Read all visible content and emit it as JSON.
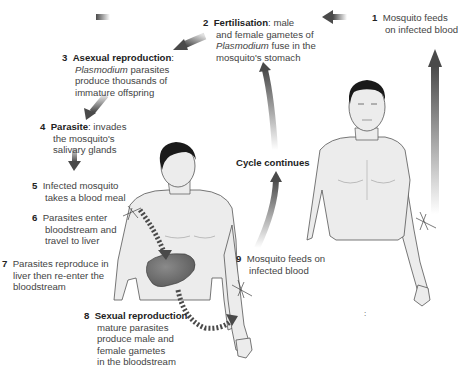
{
  "diagram": {
    "steps": [
      {
        "n": "1",
        "bold": "",
        "lines": [
          "Mosquito feeds",
          "on infected blood"
        ]
      },
      {
        "n": "2",
        "bold": "Fertilisation",
        "rest": ": male",
        "lines": [
          "and female gametes of",
          "Plasmodium fuse in the",
          "mosquito's stomach"
        ],
        "italic": "Plasmodium"
      },
      {
        "n": "3",
        "bold": "Asexual reproduction",
        "rest": ":",
        "lines": [
          "Plasmodium parasites",
          "produce thousands of",
          "immature offspring"
        ],
        "italic": "Plasmodium"
      },
      {
        "n": "4",
        "bold": "Parasite",
        "rest": ": invades",
        "lines": [
          "the mosquito's",
          "salivary glands"
        ]
      },
      {
        "n": "5",
        "bold": "",
        "lines": [
          "Infected mosquito",
          "takes a blood meal"
        ]
      },
      {
        "n": "6",
        "bold": "",
        "lines": [
          "Parasites enter",
          "bloodstream and",
          "travel to liver"
        ]
      },
      {
        "n": "7",
        "bold": "",
        "lines": [
          "Parasites reproduce in",
          "liver then re-enter the",
          "bloodstream"
        ]
      },
      {
        "n": "8",
        "bold": "Sexual reproduction",
        "lines": [
          "mature parasites",
          "produce male and",
          "female gametes",
          "in the bloodstream"
        ]
      },
      {
        "n": "9",
        "bold": "",
        "lines": [
          "Mosquito feeds on",
          "infected blood"
        ]
      }
    ],
    "cycle_label": "Cycle continues",
    "stray_mark": ":",
    "colors": {
      "arrow_dark": "#4a4a4a",
      "arrow_light": "#d0d0d0",
      "skin": "#ececec",
      "outline": "#555555",
      "hair": "#1a1a1a",
      "liver": "#6e6e6e"
    }
  }
}
